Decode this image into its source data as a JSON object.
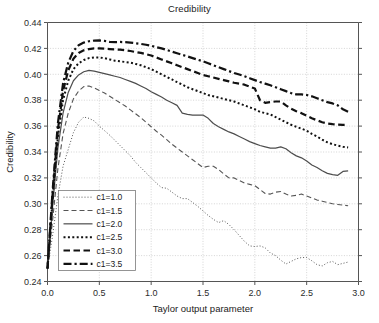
{
  "chart_data": {
    "type": "line",
    "title": "Credibility",
    "xlabel": "Taylor output parameter",
    "ylabel": "Credibility",
    "xlim": [
      0.0,
      3.0
    ],
    "ylim": [
      0.24,
      0.44
    ],
    "xticks": [
      "0.0",
      "0.5",
      "1.0",
      "1.5",
      "2.0",
      "2.5",
      "3.0"
    ],
    "xtick_values": [
      0.0,
      0.5,
      1.0,
      1.5,
      2.0,
      2.5,
      3.0
    ],
    "yticks": [
      "0.24",
      "0.26",
      "0.28",
      "0.30",
      "0.32",
      "0.34",
      "0.36",
      "0.38",
      "0.40",
      "0.42",
      "0.44"
    ],
    "ytick_values": [
      0.24,
      0.26,
      0.28,
      0.3,
      0.32,
      0.34,
      0.36,
      0.38,
      0.4,
      0.42,
      0.44
    ],
    "grid": true,
    "legend_position": "lower-left-inside",
    "x": [
      0.0,
      0.05,
      0.1,
      0.15,
      0.2,
      0.25,
      0.3,
      0.35,
      0.4,
      0.45,
      0.5,
      0.55,
      0.6,
      0.65,
      0.7,
      0.75,
      0.8,
      0.85,
      0.9,
      0.95,
      1.0,
      1.05,
      1.1,
      1.15,
      1.2,
      1.25,
      1.3,
      1.35,
      1.4,
      1.45,
      1.5,
      1.55,
      1.6,
      1.65,
      1.7,
      1.75,
      1.8,
      1.85,
      1.9,
      1.95,
      2.0,
      2.05,
      2.1,
      2.15,
      2.2,
      2.25,
      2.3,
      2.35,
      2.4,
      2.45,
      2.5,
      2.55,
      2.6,
      2.65,
      2.7,
      2.75,
      2.8,
      2.85,
      2.9
    ],
    "series": [
      {
        "name": "c1=1.0",
        "style": "dotted-thin",
        "color": "#555555",
        "width": 1.0,
        "values": [
          0.25,
          0.276,
          0.306,
          0.329,
          0.342,
          0.355,
          0.363,
          0.367,
          0.366,
          0.364,
          0.36,
          0.3565,
          0.353,
          0.349,
          0.345,
          0.341,
          0.337,
          0.332,
          0.328,
          0.324,
          0.32,
          0.316,
          0.3125,
          0.312,
          0.309,
          0.306,
          0.304,
          0.304,
          0.301,
          0.298,
          0.2945,
          0.291,
          0.288,
          0.2855,
          0.287,
          0.284,
          0.28,
          0.2755,
          0.271,
          0.2675,
          0.267,
          0.2675,
          0.266,
          0.262,
          0.26,
          0.2565,
          0.2535,
          0.2555,
          0.2575,
          0.2585,
          0.2585,
          0.256,
          0.253,
          0.252,
          0.2545,
          0.2555,
          0.253,
          0.254,
          0.255
        ]
      },
      {
        "name": "c1=1.5",
        "style": "dashed-thin",
        "color": "#555555",
        "width": 1.1,
        "values": [
          0.25,
          0.288,
          0.327,
          0.354,
          0.37,
          0.381,
          0.387,
          0.3905,
          0.391,
          0.3895,
          0.3875,
          0.3855,
          0.383,
          0.3805,
          0.378,
          0.3755,
          0.3725,
          0.3695,
          0.3665,
          0.363,
          0.3595,
          0.356,
          0.353,
          0.3495,
          0.346,
          0.343,
          0.34,
          0.337,
          0.334,
          0.331,
          0.328,
          0.329,
          0.329,
          0.3265,
          0.323,
          0.32,
          0.32,
          0.318,
          0.316,
          0.315,
          0.314,
          0.311,
          0.308,
          0.3075,
          0.309,
          0.3095,
          0.3075,
          0.306,
          0.3065,
          0.3075,
          0.306,
          0.3045,
          0.303,
          0.302,
          0.301,
          0.3,
          0.2995,
          0.299,
          0.2985
        ]
      },
      {
        "name": "c1=2.0",
        "style": "solid",
        "color": "#4d4d4d",
        "width": 1.2,
        "values": [
          0.25,
          0.299,
          0.343,
          0.37,
          0.386,
          0.395,
          0.3995,
          0.402,
          0.403,
          0.4025,
          0.4015,
          0.4005,
          0.3995,
          0.3985,
          0.3975,
          0.396,
          0.3945,
          0.393,
          0.391,
          0.389,
          0.3865,
          0.3845,
          0.3825,
          0.38,
          0.378,
          0.376,
          0.37,
          0.369,
          0.3685,
          0.3685,
          0.3685,
          0.366,
          0.362,
          0.3595,
          0.3575,
          0.3555,
          0.354,
          0.352,
          0.35,
          0.348,
          0.3465,
          0.345,
          0.344,
          0.343,
          0.343,
          0.344,
          0.3425,
          0.3395,
          0.337,
          0.3355,
          0.333,
          0.33,
          0.328,
          0.3255,
          0.3235,
          0.3225,
          0.322,
          0.325,
          0.3255
        ]
      },
      {
        "name": "c1=2.5",
        "style": "dotted-thick",
        "color": "#111111",
        "width": 2.0,
        "values": [
          0.25,
          0.305,
          0.352,
          0.38,
          0.395,
          0.404,
          0.4085,
          0.411,
          0.4125,
          0.413,
          0.413,
          0.4125,
          0.4115,
          0.4105,
          0.41,
          0.4095,
          0.409,
          0.408,
          0.407,
          0.4055,
          0.404,
          0.402,
          0.4,
          0.398,
          0.396,
          0.394,
          0.392,
          0.39,
          0.3885,
          0.387,
          0.3855,
          0.384,
          0.383,
          0.382,
          0.381,
          0.38,
          0.379,
          0.3775,
          0.376,
          0.3745,
          0.373,
          0.371,
          0.37,
          0.369,
          0.367,
          0.365,
          0.363,
          0.361,
          0.3595,
          0.358,
          0.3565,
          0.354,
          0.352,
          0.3495,
          0.3475,
          0.346,
          0.345,
          0.344,
          0.3435
        ]
      },
      {
        "name": "c1=3.0",
        "style": "dashed-thick",
        "color": "#111111",
        "width": 2.2,
        "values": [
          0.25,
          0.308,
          0.357,
          0.387,
          0.403,
          0.412,
          0.4165,
          0.4185,
          0.4195,
          0.42,
          0.42,
          0.4198,
          0.4195,
          0.4192,
          0.419,
          0.4185,
          0.418,
          0.4172,
          0.4165,
          0.4155,
          0.4145,
          0.413,
          0.4115,
          0.41,
          0.4085,
          0.407,
          0.4055,
          0.404,
          0.4025,
          0.401,
          0.3995,
          0.3985,
          0.3975,
          0.3965,
          0.3955,
          0.3945,
          0.3935,
          0.3928,
          0.392,
          0.3905,
          0.389,
          0.38,
          0.378,
          0.3785,
          0.379,
          0.379,
          0.376,
          0.3735,
          0.3715,
          0.37,
          0.368,
          0.366,
          0.3645,
          0.363,
          0.362,
          0.3615,
          0.3612,
          0.361,
          0.361
        ]
      },
      {
        "name": "c1=3.5",
        "style": "dashdot-thick",
        "color": "#111111",
        "width": 2.2,
        "values": [
          0.25,
          0.311,
          0.362,
          0.393,
          0.409,
          0.418,
          0.4225,
          0.4245,
          0.4255,
          0.426,
          0.4262,
          0.4258,
          0.425,
          0.4248,
          0.425,
          0.4248,
          0.4245,
          0.424,
          0.4235,
          0.4228,
          0.422,
          0.421,
          0.42,
          0.4188,
          0.4175,
          0.4162,
          0.415,
          0.4138,
          0.4125,
          0.4112,
          0.41,
          0.4085,
          0.407,
          0.4055,
          0.404,
          0.4025,
          0.401,
          0.3998,
          0.3985,
          0.397,
          0.3955,
          0.394,
          0.3928,
          0.3915,
          0.39,
          0.3885,
          0.387,
          0.3855,
          0.3845,
          0.3845,
          0.384,
          0.383,
          0.3815,
          0.38,
          0.3785,
          0.3775,
          0.376,
          0.373,
          0.371
        ]
      }
    ]
  }
}
